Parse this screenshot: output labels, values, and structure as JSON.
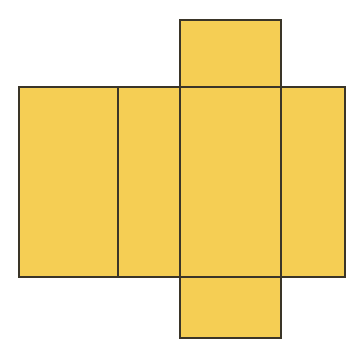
{
  "figure": {
    "canvas": {
      "width": 364,
      "height": 355,
      "background": "#ffffff"
    },
    "style": {
      "fill": "#f5ce54",
      "stroke": "#3a3528",
      "stroke_width": 2
    },
    "faces": [
      {
        "id": "face-left-side",
        "label": "left side face",
        "x": 19,
        "y": 87,
        "width": 99,
        "height": 190
      },
      {
        "id": "face-back",
        "label": "back face",
        "x": 118,
        "y": 87,
        "width": 62,
        "height": 190
      },
      {
        "id": "face-front",
        "label": "front face",
        "x": 180,
        "y": 87,
        "width": 101,
        "height": 190
      },
      {
        "id": "face-right-side",
        "label": "right side face",
        "x": 281,
        "y": 87,
        "width": 64,
        "height": 190
      },
      {
        "id": "face-top",
        "label": "top face",
        "x": 180,
        "y": 20,
        "width": 101,
        "height": 67
      },
      {
        "id": "face-bottom",
        "label": "bottom face",
        "x": 180,
        "y": 277,
        "width": 101,
        "height": 61
      }
    ],
    "fold_lines": [
      {
        "id": "fold-1",
        "x1": 118,
        "y1": 87,
        "x2": 118,
        "y2": 277
      },
      {
        "id": "fold-2",
        "x1": 180,
        "y1": 87,
        "x2": 180,
        "y2": 277
      },
      {
        "id": "fold-3",
        "x1": 281,
        "y1": 87,
        "x2": 281,
        "y2": 277
      },
      {
        "id": "fold-4",
        "x1": 180,
        "y1": 87,
        "x2": 281,
        "y2": 87
      },
      {
        "id": "fold-5",
        "x1": 180,
        "y1": 277,
        "x2": 281,
        "y2": 277
      }
    ],
    "watermark": {
      "line_top": "",
      "line_mid": ""
    }
  }
}
